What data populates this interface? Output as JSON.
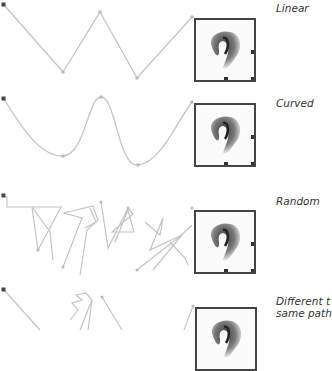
{
  "figure": {
    "line_color": "#bdbdbd",
    "anchor_color": "#444444",
    "frame_color": "#444444"
  },
  "panels": [
    {
      "id": "linear",
      "label": "Linear",
      "top": 0
    },
    {
      "id": "curved",
      "label": "Curved",
      "top": 85
    },
    {
      "id": "random",
      "label": "Random",
      "top": 170
    },
    {
      "id": "timing",
      "label_line1": "Different t",
      "label_line2": "same path",
      "top": 255
    }
  ],
  "icons": {
    "start_point": "start-anchor-icon",
    "waypoint": "waypoint-icon",
    "object": "fortune-cookie-image"
  }
}
